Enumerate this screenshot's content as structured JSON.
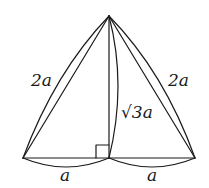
{
  "diagram": {
    "type": "geometry",
    "labels": {
      "left_side": "2a",
      "right_side": "2a",
      "altitude": "√3a",
      "left_base": "a",
      "right_base": "a"
    },
    "points": {
      "apex": [
        109,
        16
      ],
      "left": [
        23,
        158
      ],
      "right": [
        195,
        158
      ],
      "foot": [
        109,
        158
      ]
    },
    "right_angle_marker": true,
    "colors": {
      "stroke": "#1a1a1a",
      "background": "#ffffff"
    }
  }
}
